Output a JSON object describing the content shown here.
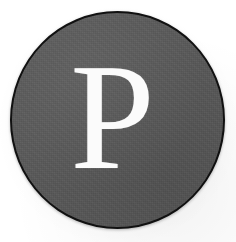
{
  "emblem": {
    "letter": "P",
    "shape": "circle",
    "disc_fill_color": "#5a5a5a",
    "disc_border_color": "#111111",
    "letter_color": "#fbfbfb",
    "background_color": "#ffffff"
  }
}
